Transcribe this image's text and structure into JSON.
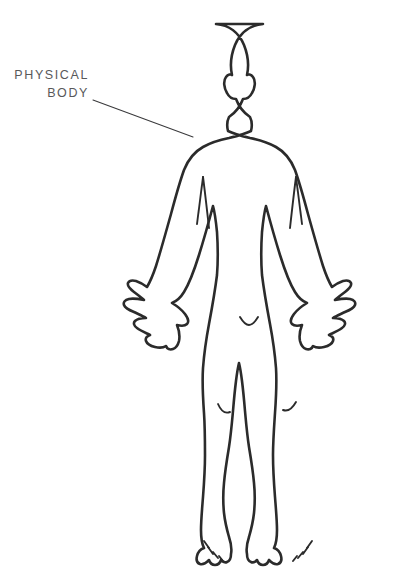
{
  "document": {
    "title": "Physical Body",
    "background_color": "#ffffff",
    "width": 412,
    "height": 587
  },
  "annotation": {
    "label_line_1": "PHYSICAL",
    "label_line_2": "BODY",
    "text_color": "#58585a",
    "leader_line_color": "#3a3a3c",
    "leader_start_x": 93,
    "leader_start_y": 100,
    "leader_end_x": 193,
    "leader_end_y": 137,
    "label_anchor_x": 89,
    "label_line_1_y": 79,
    "label_line_2_y": 97
  },
  "figure": {
    "name": "human-body-outline",
    "view": "front",
    "pose": "standing, arms lowered and away from body, palms forward, fingers splayed",
    "stroke_color": "#2b2b2b",
    "fill_color": "#ffffff",
    "parts": [
      "head",
      "ears",
      "neck",
      "shoulders",
      "torso",
      "arms",
      "hands",
      "legs",
      "knees",
      "feet",
      "toes"
    ],
    "detail_marks": {
      "left_armpit_crease": "short vertical line under left shoulder",
      "right_armpit_crease": "short vertical line under right shoulder",
      "crotch_notch": "small inverted V at the groin",
      "left_knee_arc": "small curved arc on left knee",
      "right_knee_arc": "small curved arc on right knee",
      "left_foot_toes": "short hatch marks for toes",
      "right_foot_toes": "short hatch marks for toes"
    }
  }
}
